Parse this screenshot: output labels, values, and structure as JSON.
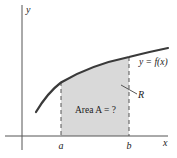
{
  "diagram": {
    "type": "area-under-curve",
    "axes": {
      "x_label": "x",
      "y_label": "y"
    },
    "curve_label": "y = f(x)",
    "bounds": {
      "left": "a",
      "right": "b"
    },
    "region_label": "R",
    "area_label": "Area A = ?",
    "colors": {
      "curve": "#3a3a3a",
      "axis": "#444444",
      "fill": "#d9d9d9",
      "dash": "#555555"
    }
  }
}
